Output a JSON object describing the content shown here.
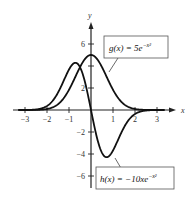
{
  "chart_data": {
    "type": "line",
    "title": "",
    "xlabel": "x",
    "ylabel": "y",
    "xlim": [
      -3.3,
      3.4
    ],
    "ylim": [
      -7,
      7.5
    ],
    "grid": false,
    "x_ticks": [
      -3,
      -2,
      -1,
      1,
      2,
      3
    ],
    "x_tick_labels": [
      "−3",
      "−2",
      "−1",
      "1",
      "2",
      "3"
    ],
    "y_ticks": [
      6,
      2,
      -2,
      -4,
      -6
    ],
    "y_tick_labels": [
      "6",
      "2",
      "−2",
      "−4",
      "−6"
    ],
    "y_minor_ticks": [
      4
    ],
    "series": [
      {
        "name": "g(x) = 5e^{-x^2}",
        "label": "g(x) = 5e",
        "exponent": "−x²",
        "formula": "5*exp(-x^2)",
        "x": [
          -3,
          -2.5,
          -2,
          -1.5,
          -1,
          -0.5,
          0,
          0.5,
          1,
          1.5,
          2,
          2.5,
          3
        ],
        "values": [
          0.0006,
          0.0097,
          0.0916,
          0.527,
          1.839,
          3.894,
          5.0,
          3.894,
          1.839,
          0.527,
          0.0916,
          0.0097,
          0.0006
        ]
      },
      {
        "name": "h(x) = -10xe^{-x^2}",
        "label": "h(x) = −10xe",
        "exponent": "−x²",
        "formula": "-10*x*exp(-x^2)",
        "x": [
          -3,
          -2.5,
          -2,
          -1.5,
          -1,
          -0.707,
          -0.5,
          0,
          0.5,
          0.707,
          1,
          1.5,
          2,
          2.5,
          3
        ],
        "values": [
          0.0037,
          0.048,
          0.366,
          1.581,
          3.679,
          4.289,
          3.894,
          0,
          -3.894,
          -4.289,
          -3.679,
          -1.581,
          -0.366,
          -0.048,
          -0.0037
        ]
      }
    ]
  }
}
